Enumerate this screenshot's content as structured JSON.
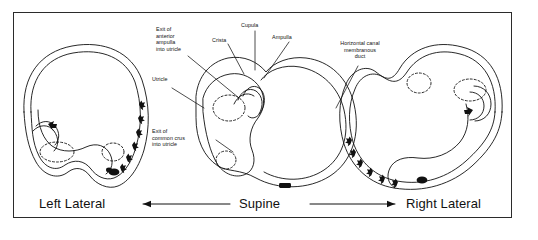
{
  "figure": {
    "frame_color": "#2b2b2b",
    "ink_color": "#111111",
    "background": "#ffffff"
  },
  "labels": [
    {
      "id": "exit-anterior-ampulla",
      "text": "Exit of\nanterior\nampulla\ninto utricle",
      "align": "left"
    },
    {
      "id": "crista",
      "text": "Crista",
      "align": "left"
    },
    {
      "id": "cupula",
      "text": "Cupula",
      "align": "left"
    },
    {
      "id": "ampulla",
      "text": "Ampulla",
      "align": "left"
    },
    {
      "id": "horizontal-canal-duct",
      "text": "Horizontal canal\nmembranous\nduct",
      "align": "center"
    },
    {
      "id": "utricle",
      "text": "Utricle",
      "align": "left"
    },
    {
      "id": "exit-common-crus",
      "text": "Exit of\ncommon crus\ninto utricle",
      "align": "left"
    }
  ],
  "captions": {
    "left": "Left Lateral",
    "center": "Supine",
    "right": "Right Lateral"
  },
  "arrows": {
    "left_arrow_direction": "left",
    "right_arrow_direction": "right"
  },
  "panels": [
    {
      "id": "left-lateral",
      "position": "Left Lateral",
      "debris_marker": "dark clump at lower canal",
      "particle_count": 7
    },
    {
      "id": "supine",
      "position": "Supine",
      "debris_marker": "dark clump at canal base",
      "particle_count": 0
    },
    {
      "id": "right-lateral",
      "position": "Right Lateral",
      "debris_marker": "dark clump at lower canal",
      "particle_count": 7
    }
  ]
}
